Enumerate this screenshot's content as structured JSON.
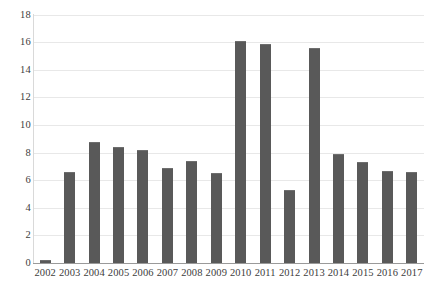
{
  "chart_data": {
    "type": "bar",
    "title": "",
    "subtitle": "",
    "xlabel": "",
    "ylabel": "",
    "categories": [
      "2002",
      "2003",
      "2004",
      "2005",
      "2006",
      "2007",
      "2008",
      "2009",
      "2010",
      "2011",
      "2012",
      "2013",
      "2014",
      "2015",
      "2016",
      "2017"
    ],
    "values": [
      0.2,
      6.6,
      8.8,
      8.4,
      8.2,
      6.9,
      7.4,
      6.5,
      16.1,
      15.9,
      5.3,
      15.6,
      7.9,
      7.3,
      6.7,
      6.6
    ],
    "series": [
      {
        "name": "Series 1",
        "values": [
          0.2,
          6.6,
          8.8,
          8.4,
          8.2,
          6.9,
          7.4,
          6.5,
          16.1,
          15.9,
          5.3,
          15.6,
          7.9,
          7.3,
          6.7,
          6.6
        ]
      }
    ],
    "ylim": [
      0,
      18
    ],
    "ytick_values": [
      0,
      2,
      4,
      6,
      8,
      10,
      12,
      14,
      16,
      18
    ],
    "ytick_labels": [
      "0",
      "2",
      "4",
      "6",
      "8",
      "10",
      "12",
      "14",
      "16",
      "18"
    ],
    "grid": true,
    "grid_axis": "y",
    "legend": false,
    "legend_position": "none",
    "bar_color": "#595959",
    "grid_color": "#e8e8e8",
    "axis_color": "#9a9a9a",
    "text_color": "#3d3d3d",
    "background": "#ffffff"
  }
}
